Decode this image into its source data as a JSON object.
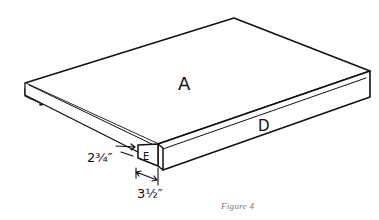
{
  "figure": {
    "caption": "Figure 4",
    "labels": {
      "top_panel": "A",
      "front_rail": "D",
      "end_block": "E"
    },
    "dimensions": {
      "height": "2¾″",
      "width": "3½″"
    }
  }
}
